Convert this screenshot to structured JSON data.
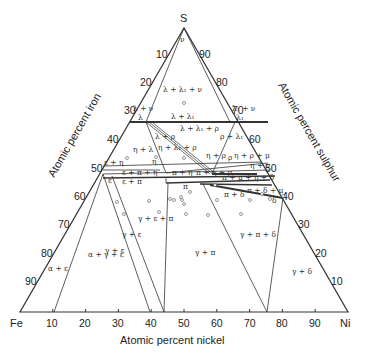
{
  "vertices": {
    "top": "S",
    "left": "Fe",
    "right": "Ni"
  },
  "axes": {
    "bottom": {
      "title": "Atomic percent nickel",
      "ticks": [
        "10",
        "20",
        "30",
        "40",
        "50",
        "60",
        "70",
        "80",
        "90"
      ]
    },
    "left": {
      "title": "Atomic percent iron",
      "ticks": [
        "10",
        "20",
        "30",
        "40",
        "50",
        "60",
        "70",
        "80",
        "90"
      ]
    },
    "right": {
      "title": "Atomic percent sulphur",
      "ticks": [
        "90",
        "80",
        "70",
        "60",
        "50",
        "40",
        "30",
        "20",
        "10"
      ]
    }
  },
  "phase_labels": {
    "nu": "ν",
    "l_l1_nu": "λ + λ₁ + ν",
    "l_nu": "λ + ν",
    "l1_nu": "λ₁ + ν",
    "l_left": "λ",
    "l_l1": "λ + λ₁",
    "l1_right": "λ₁",
    "l_l1_rho": "λ + λ₁ + ρ",
    "l_rho": "λ + ρ",
    "rho_l1": "ρ + λ₁",
    "eta_l": "η + λ",
    "eta_l1_rho": "η + λ₁ + ρ",
    "rho": "ρ",
    "eta_rho": "η + ρ",
    "eta_rho_mu": "η + ρ + μ",
    "eta_nu": "η + ν",
    "eps_eta": "ε + η",
    "eta": "η",
    "eps_pi_eta": "ε + π + η",
    "pi_eta": "π + η",
    "pi_eta_mu": "π + η + μ",
    "pi_mu_eta_delta": "π + μ + η + δ",
    "eps": "ε",
    "eps_pi": "ε + π",
    "pi": "π",
    "pi_delta_mu": "π + δ + μ",
    "pi_delta": "π + δ",
    "delta": "δ",
    "gam_eps_pi": "γ + ε + π",
    "gam_eps_a": "γ + ε",
    "gam_eps_b": "γ + ε",
    "a_gam_eps": "α + γ + ε",
    "a_eps": "α + ε",
    "gam_pi": "γ + π",
    "gam_pi_delta": "γ + π + δ",
    "gam_delta": "γ + δ"
  }
}
